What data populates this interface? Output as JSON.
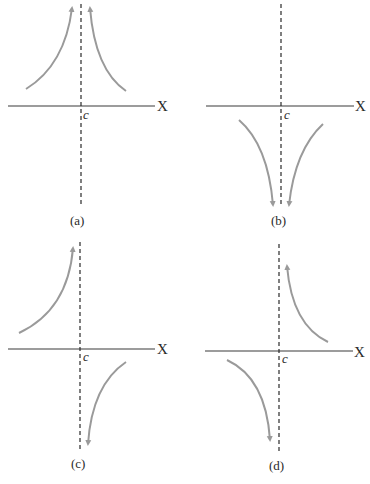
{
  "panels": [
    {
      "id": "a",
      "caption": "(a)",
      "axis_label": "X",
      "point_label": "c"
    },
    {
      "id": "b",
      "caption": "(b)",
      "axis_label": "X",
      "point_label": "c"
    },
    {
      "id": "c",
      "caption": "(c)",
      "axis_label": "X",
      "point_label": "c"
    },
    {
      "id": "d",
      "caption": "(d)",
      "axis_label": "X",
      "point_label": "c"
    }
  ],
  "colors": {
    "curve": "#9a9a9a",
    "axis": "#3a3a3a"
  }
}
